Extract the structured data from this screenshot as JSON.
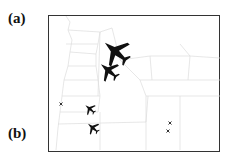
{
  "labels": {
    "a": "(a)",
    "b": "(b)"
  },
  "map": {
    "region": "Oregon counties",
    "boundary_color": "#d8d8d8",
    "frame_color": "#333333",
    "markers": [
      {
        "type": "airplane",
        "size": "large",
        "x": 116,
        "y": 52
      },
      {
        "type": "airplane",
        "size": "medium",
        "x": 109,
        "y": 71
      },
      {
        "type": "airplane",
        "size": "small",
        "x": 90,
        "y": 109
      },
      {
        "type": "airplane",
        "size": "small",
        "x": 93,
        "y": 128
      },
      {
        "type": "x-mark",
        "size": "tiny",
        "x": 61,
        "y": 104
      },
      {
        "type": "x-mark",
        "size": "tiny",
        "x": 170,
        "y": 123
      },
      {
        "type": "x-mark",
        "size": "tiny",
        "x": 168,
        "y": 131
      }
    ]
  }
}
